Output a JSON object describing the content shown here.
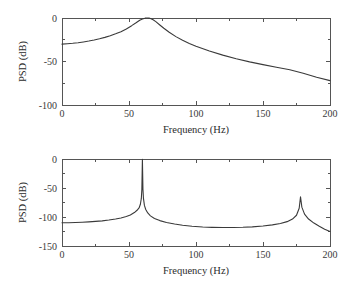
{
  "figure": {
    "background": "#ffffff",
    "curve_color": "#3a3a3a",
    "axis_color": "#555555"
  },
  "chart_data": [
    {
      "type": "line",
      "panel": "top",
      "title": "",
      "xlabel": "Frequency (Hz)",
      "ylabel": "PSD (dB)",
      "xlim": [
        0,
        200
      ],
      "ylim": [
        -100,
        0
      ],
      "xticks": [
        0,
        50,
        100,
        150,
        200
      ],
      "xticklabels": [
        "0",
        "50",
        "100",
        "150",
        "200"
      ],
      "xminorticks": [
        25,
        75,
        125,
        175
      ],
      "yticks": [
        0,
        -50,
        -100
      ],
      "yticklabels": [
        "0",
        "-50",
        "-100"
      ],
      "yminorticks": [
        -25,
        -75
      ],
      "grid": false,
      "legend": null,
      "annotations": [],
      "series": [
        {
          "name": "PSD",
          "peak_frequency_hz": 64,
          "peak_value_db": 0,
          "x": [
            0,
            4,
            8,
            12,
            16,
            20,
            24,
            28,
            32,
            36,
            40,
            44,
            48,
            52,
            55,
            58,
            60,
            62,
            63,
            64,
            65,
            66,
            68,
            70,
            73,
            76,
            80,
            85,
            90,
            95,
            100,
            110,
            120,
            130,
            140,
            150,
            160,
            170,
            180,
            190,
            200
          ],
          "y": [
            -30.0,
            -29.6,
            -29.1,
            -28.4,
            -27.5,
            -26.5,
            -25.3,
            -23.9,
            -22.3,
            -20.4,
            -18.2,
            -15.7,
            -12.6,
            -8.8,
            -5.8,
            -2.6,
            -1.1,
            -0.2,
            -0.05,
            0.0,
            -0.1,
            -0.5,
            -2.0,
            -4.2,
            -8.0,
            -11.8,
            -16.4,
            -21.4,
            -25.6,
            -29.2,
            -32.4,
            -38.0,
            -42.7,
            -46.8,
            -50.4,
            -53.6,
            -56.6,
            -59.4,
            -63.6,
            -68.2,
            -72.0
          ]
        }
      ]
    },
    {
      "type": "line",
      "panel": "bottom",
      "title": "",
      "xlabel": "Frequency (Hz)",
      "ylabel": "PSD (dB)",
      "xlim": [
        0,
        200
      ],
      "ylim": [
        -150,
        0
      ],
      "xticks": [
        0,
        50,
        100,
        150,
        200
      ],
      "xticklabels": [
        "0",
        "50",
        "100",
        "150",
        "200"
      ],
      "xminorticks": [
        25,
        75,
        125,
        175
      ],
      "yticks": [
        0,
        -50,
        -100,
        -150
      ],
      "yticklabels": [
        "0",
        "-50",
        "-100",
        "-150"
      ],
      "yminorticks": [
        -25,
        -75,
        -125
      ],
      "grid": false,
      "legend": null,
      "annotations": [],
      "series": [
        {
          "name": "PSD",
          "peak_frequency_hz": 60,
          "peak_value_db": 0,
          "second_peak_frequency_hz": 178,
          "second_peak_value_db": -65,
          "x": [
            0,
            5,
            10,
            15,
            20,
            25,
            30,
            35,
            40,
            44,
            48,
            51,
            54,
            56,
            57.5,
            58.5,
            59.2,
            59.6,
            60,
            60.4,
            60.8,
            61.5,
            62.5,
            64,
            66,
            69,
            73,
            78,
            84,
            90,
            97,
            105,
            112,
            120,
            128,
            135,
            142,
            150,
            157,
            163,
            168,
            172,
            175,
            177,
            178,
            179,
            181,
            184,
            188,
            192,
            196,
            200
          ],
          "y": [
            -110.0,
            -109.8,
            -109.5,
            -109.0,
            -108.4,
            -107.6,
            -106.6,
            -105.3,
            -103.5,
            -101.6,
            -99.0,
            -96.4,
            -92.4,
            -88.4,
            -84.4,
            -78.0,
            -68.0,
            -52.0,
            -0.5,
            -52.0,
            -68.0,
            -80.0,
            -87.0,
            -93.0,
            -98.0,
            -102.5,
            -106.2,
            -109.4,
            -112.2,
            -114.3,
            -116.0,
            -117.3,
            -117.9,
            -118.2,
            -118.2,
            -117.8,
            -117.0,
            -115.6,
            -113.6,
            -111.2,
            -108.0,
            -103.5,
            -97.0,
            -85.0,
            -65.0,
            -83.0,
            -95.0,
            -103.5,
            -110.5,
            -116.0,
            -121.0,
            -125.0
          ]
        }
      ]
    }
  ]
}
